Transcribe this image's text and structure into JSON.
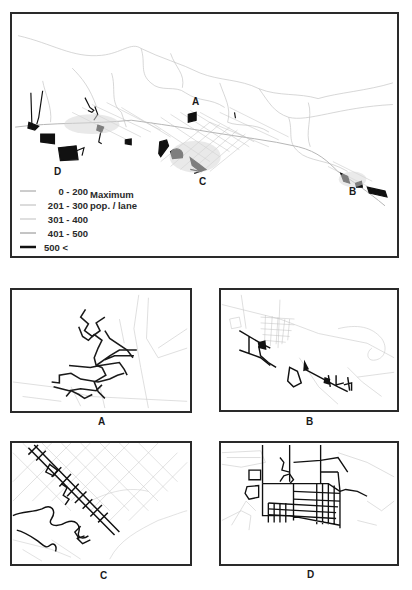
{
  "main_map": {
    "region_labels": [
      {
        "id": "A",
        "text": "A"
      },
      {
        "id": "B",
        "text": "B"
      },
      {
        "id": "C",
        "text": "C"
      },
      {
        "id": "D",
        "text": "D"
      }
    ],
    "legend": {
      "title_line1": "Maximum",
      "title_line2": "pop. / lane",
      "classes": [
        {
          "range": "0  -  200",
          "stroke_color": "#9a9a9a",
          "stroke_width": 1
        },
        {
          "range": "201 - 300",
          "stroke_color": "#b8b8b8",
          "stroke_width": 1
        },
        {
          "range": "301 - 400",
          "stroke_color": "#d4d4d4",
          "stroke_width": 1.5
        },
        {
          "range": "401 - 500",
          "stroke_color": "#8a8a8a",
          "stroke_width": 1
        },
        {
          "range": "500 <",
          "stroke_color": "#111111",
          "stroke_width": 2.5
        }
      ]
    }
  },
  "detail_panels": [
    {
      "id": "A",
      "caption": "A"
    },
    {
      "id": "B",
      "caption": "B"
    },
    {
      "id": "C",
      "caption": "C"
    },
    {
      "id": "D",
      "caption": "D"
    }
  ],
  "colors": {
    "frame": "#2a2a2a",
    "heavy_road": "#111111",
    "light_road": "#c8c8c8"
  }
}
